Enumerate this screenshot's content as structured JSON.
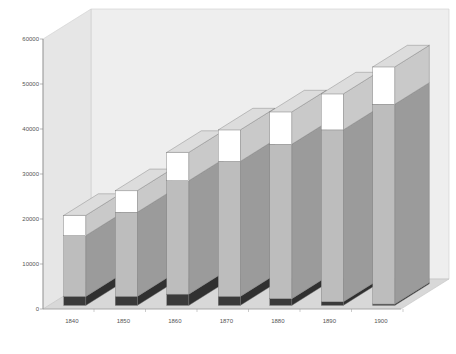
{
  "chart_data": {
    "type": "bar",
    "subtype": "3d-stacked",
    "title": "",
    "xlabel": "",
    "ylabel": "",
    "categories": [
      "1840",
      "1850",
      "1860",
      "1870",
      "1880",
      "1890",
      "1900"
    ],
    "series": [
      {
        "name": "bottom (dark)",
        "color": "#3a3a3a",
        "values": [
          2000,
          2000,
          2500,
          2000,
          1500,
          800,
          300
        ]
      },
      {
        "name": "middle (gray)",
        "color": "#bdbdbd",
        "values": [
          13500,
          18700,
          25200,
          30000,
          34300,
          38200,
          44400
        ]
      },
      {
        "name": "top (white)",
        "color": "#ffffff",
        "values": [
          4500,
          4800,
          6300,
          7000,
          7200,
          8000,
          8300
        ]
      }
    ],
    "totals": [
      20000,
      25500,
      34000,
      39000,
      43000,
      47000,
      53000
    ],
    "yticks": [
      0,
      10000,
      20000,
      30000,
      40000,
      50000,
      60000
    ],
    "ylim": [
      0,
      60000
    ],
    "grid": false,
    "legend": "none"
  }
}
